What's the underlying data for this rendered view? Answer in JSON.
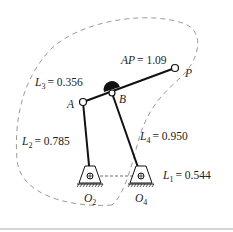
{
  "diagram": {
    "type": "four-bar linkage with coupler curve",
    "links": {
      "L1": {
        "symbol": "L",
        "sub": "1",
        "value": "= 0.544"
      },
      "L2": {
        "symbol": "L",
        "sub": "2",
        "value": "= 0.785"
      },
      "L3": {
        "symbol": "L",
        "sub": "3",
        "value": "= 0.356"
      },
      "L4": {
        "symbol": "L",
        "sub": "4",
        "value": "= 0.950"
      },
      "AP": {
        "symbol": "AP",
        "value": "= 1.09"
      }
    },
    "points": {
      "A": "A",
      "B": "B",
      "P": "P",
      "O2": {
        "symbol": "O",
        "sub": "2"
      },
      "O4": {
        "symbol": "O",
        "sub": "4"
      }
    },
    "colors": {
      "link": "#111111",
      "curve": "#9a9a9a",
      "text": "#222222"
    }
  }
}
